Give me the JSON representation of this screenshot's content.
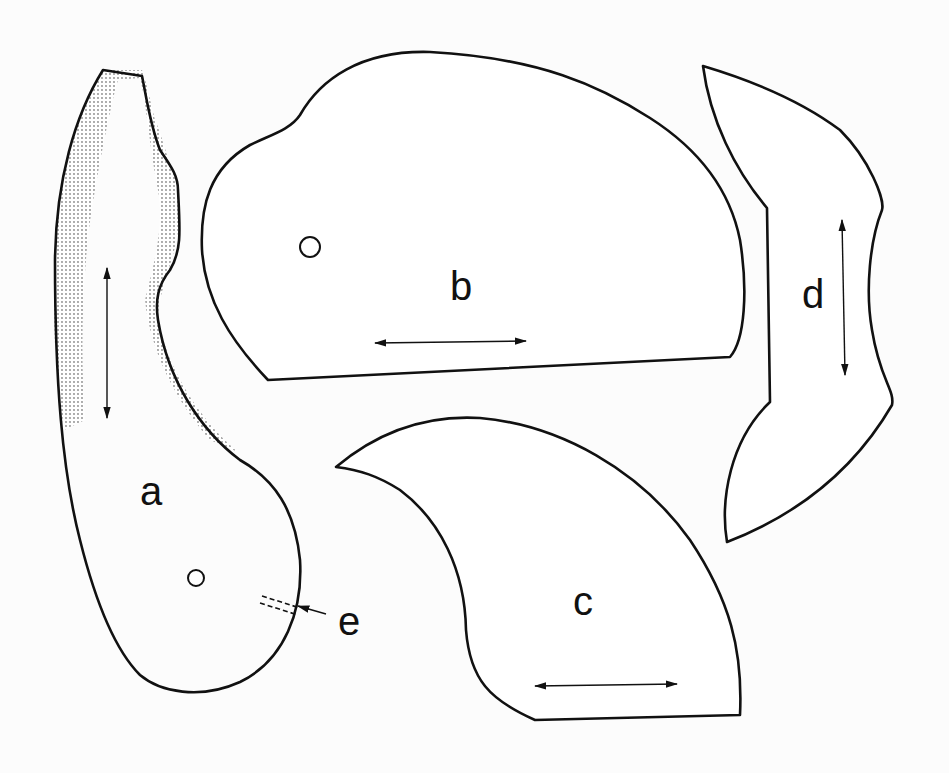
{
  "figure": {
    "pieces": [
      {
        "id": "a",
        "label": "a",
        "grain": "vertical",
        "has_hole": true,
        "shaded_edge": true
      },
      {
        "id": "b",
        "label": "b",
        "grain": "horizontal",
        "has_hole": true
      },
      {
        "id": "c",
        "label": "c",
        "grain": "horizontal",
        "has_hole": false
      },
      {
        "id": "d",
        "label": "d",
        "grain": "vertical",
        "has_hole": false
      }
    ],
    "callout": {
      "label": "e",
      "target": "a",
      "description": "dashed slit marker"
    },
    "colors": {
      "line": "#111111",
      "shade": "#b5b5b5",
      "background": "#fcfcfc"
    }
  }
}
